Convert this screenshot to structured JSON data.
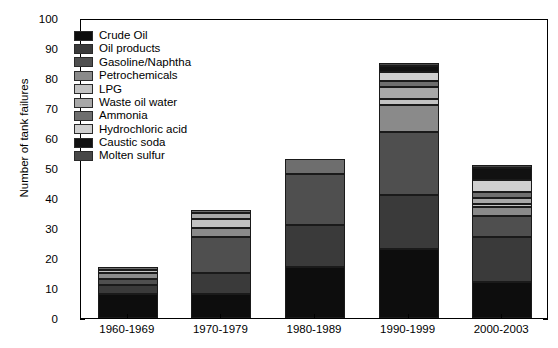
{
  "chart_data": {
    "type": "bar",
    "stacked": true,
    "title": "",
    "xlabel": "",
    "ylabel": "Number of tank failures",
    "ylim": [
      0,
      100
    ],
    "ytick_step": 10,
    "yticks": [
      0,
      10,
      20,
      30,
      40,
      50,
      60,
      70,
      80,
      90,
      100
    ],
    "grid": false,
    "legend_position": "upper-left-inside",
    "categories": [
      "1960-1969",
      "1970-1979",
      "1980-1989",
      "1990-1999",
      "2000-2003"
    ],
    "series": [
      {
        "name": "Crude Oil",
        "color": "#0d0d0d",
        "values": [
          8,
          8,
          17,
          23,
          12
        ]
      },
      {
        "name": "Oil products",
        "color": "#3a3a3a",
        "values": [
          3,
          7,
          14,
          18,
          15
        ]
      },
      {
        "name": "Gasoline/Naphtha",
        "color": "#4f4f4f",
        "values": [
          2,
          12,
          17,
          21,
          7
        ]
      },
      {
        "name": "Petrochemicals",
        "color": "#8a8a8a",
        "values": [
          2,
          3,
          0,
          9,
          3
        ]
      },
      {
        "name": "LPG",
        "color": "#c2c2c2",
        "values": [
          1,
          3,
          0,
          2,
          1
        ]
      },
      {
        "name": "Waste oil water",
        "color": "#a8a8a8",
        "values": [
          0,
          2,
          0,
          4,
          2
        ]
      },
      {
        "name": "Ammonia",
        "color": "#6e6e6e",
        "values": [
          1,
          1,
          5,
          2,
          2
        ]
      },
      {
        "name": "Hydrochloric acid",
        "color": "#cfcfcf",
        "values": [
          0,
          0,
          0,
          3,
          4
        ]
      },
      {
        "name": "Caustic soda",
        "color": "#111111",
        "values": [
          0,
          0,
          0,
          2,
          4
        ]
      },
      {
        "name": "Molten sulfur",
        "color": "#474747",
        "values": [
          0,
          0,
          0,
          1,
          1
        ]
      }
    ],
    "bar_totals": [
      17,
      36,
      53,
      85,
      51
    ]
  },
  "legend": {
    "items": [
      "Crude Oil",
      "Oil products",
      "Gasoline/Naphtha",
      "Petrochemicals",
      "LPG",
      "Waste oil water",
      "Ammonia",
      "Hydrochloric acid",
      "Caustic soda",
      "Molten sulfur"
    ]
  },
  "axes": {
    "y_label": "Number of tank failures",
    "y_ticks": [
      "0",
      "10",
      "20",
      "30",
      "40",
      "50",
      "60",
      "70",
      "80",
      "90",
      "100"
    ],
    "x_ticks": [
      "1960-1969",
      "1970-1979",
      "1980-1989",
      "1990-1999",
      "2000-2003"
    ]
  }
}
